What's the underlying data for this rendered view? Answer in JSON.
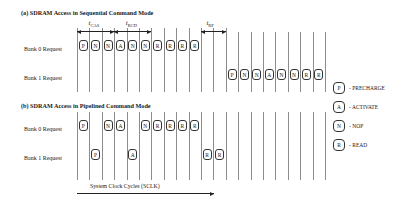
{
  "section_a": {
    "title": "(a) SDRAM Access in Sequential Command Mode",
    "rows": [
      {
        "label": "Bank 0 Request",
        "commands": [
          {
            "cell": 0,
            "code": "P"
          },
          {
            "cell": 1,
            "code": "N"
          },
          {
            "cell": 2,
            "code": "N"
          },
          {
            "cell": 3,
            "code": "A"
          },
          {
            "cell": 4,
            "code": "N"
          },
          {
            "cell": 5,
            "code": "N"
          },
          {
            "cell": 6,
            "code": "R"
          },
          {
            "cell": 7,
            "code": "R"
          },
          {
            "cell": 8,
            "code": "R"
          },
          {
            "cell": 9,
            "code": "R"
          }
        ]
      },
      {
        "label": "Bank 1 Request",
        "commands": [
          {
            "cell": 12,
            "code": "P"
          },
          {
            "cell": 13,
            "code": "N"
          },
          {
            "cell": 14,
            "code": "N"
          },
          {
            "cell": 15,
            "code": "A"
          },
          {
            "cell": 16,
            "code": "N"
          },
          {
            "cell": 17,
            "code": "N"
          },
          {
            "cell": 18,
            "code": "R"
          },
          {
            "cell": 19,
            "code": "R"
          }
        ]
      }
    ],
    "timings": [
      {
        "name": "t",
        "sub": "CAS",
        "from_line": 0,
        "to_line": 3
      },
      {
        "name": "t",
        "sub": "RCD",
        "from_line": 3,
        "to_line": 6
      },
      {
        "name": "t",
        "sub": "RP",
        "from_line": 10,
        "to_line": 12
      }
    ]
  },
  "section_b": {
    "title": "(b) SDRAM Access in Pipelined Command Mode",
    "rows": [
      {
        "label": "Bank 0 Request",
        "commands": [
          {
            "cell": 0,
            "code": "P"
          },
          {
            "cell": 2,
            "code": "N"
          },
          {
            "cell": 3,
            "code": "A"
          },
          {
            "cell": 5,
            "code": "N"
          },
          {
            "cell": 6,
            "code": "R"
          },
          {
            "cell": 7,
            "code": "R"
          },
          {
            "cell": 8,
            "code": "R"
          },
          {
            "cell": 9,
            "code": "R"
          }
        ]
      },
      {
        "label": "Bank 1 Request",
        "commands": [
          {
            "cell": 1,
            "code": "P"
          },
          {
            "cell": 4,
            "code": "A"
          },
          {
            "cell": 10,
            "code": "R"
          },
          {
            "cell": 11,
            "code": "R"
          }
        ]
      }
    ],
    "axis_label": "System Clock Cycles (SCLK)"
  },
  "legend": [
    {
      "code": "P",
      "text": "- PRECHARGE"
    },
    {
      "code": "A",
      "text": "- ACTIVATE"
    },
    {
      "code": "N",
      "text": "- NOP"
    },
    {
      "code": "R",
      "text": "- READ"
    }
  ],
  "grid": {
    "line_count": 21
  }
}
